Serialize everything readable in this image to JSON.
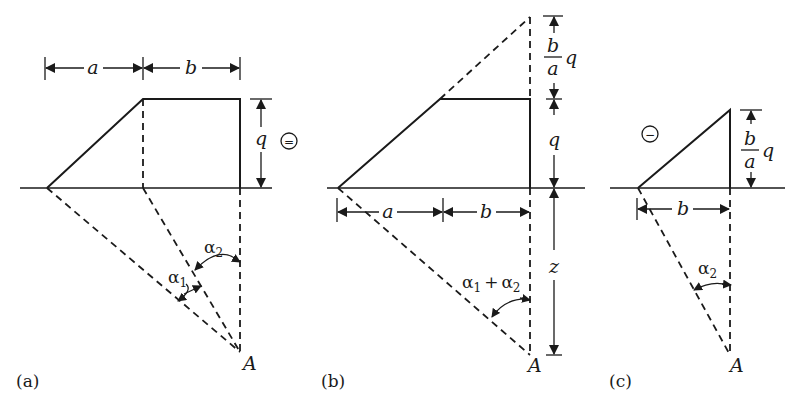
{
  "figure": {
    "panels": [
      {
        "id": "a",
        "caption": "(a)",
        "sign": "=",
        "labels": {
          "dim_a": "a",
          "dim_b": "b",
          "dim_q": "q",
          "alpha1": "α",
          "alpha1_sub": "1",
          "alpha2": "α",
          "alpha2_sub": "2",
          "point": "A"
        }
      },
      {
        "id": "b",
        "caption": "(b)",
        "labels": {
          "dim_a": "a",
          "dim_b": "b",
          "dim_q": "q",
          "frac_num": "b",
          "frac_den": "a",
          "frac_q": "q",
          "dim_z": "z",
          "alpha_sum_1": "α",
          "alpha_sum_1_sub": "1",
          "alpha_sum_plus": "+",
          "alpha_sum_2": "α",
          "alpha_sum_2_sub": "2",
          "point": "A"
        }
      },
      {
        "id": "c",
        "caption": "(c)",
        "sign": "−",
        "labels": {
          "dim_b": "b",
          "frac_num": "b",
          "frac_den": "a",
          "frac_q": "q",
          "alpha2": "α",
          "alpha2_sub": "2",
          "point": "A"
        }
      }
    ]
  }
}
